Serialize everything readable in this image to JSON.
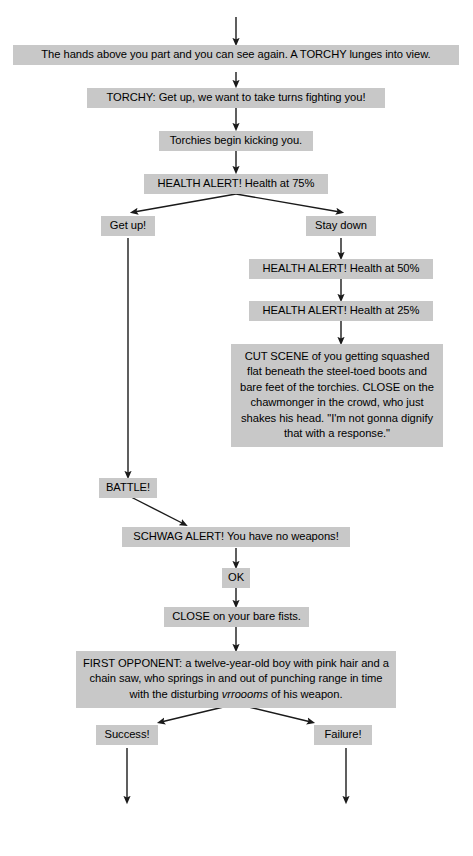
{
  "diagram": {
    "box_fill": "#c8c8c8",
    "text_color": "#000000",
    "background": "#ffffff",
    "arrow_color": "#1a1a1a"
  },
  "nodes": [
    {
      "id": "n1",
      "name": "hands-part-node",
      "text": "The hands above you part and you can see again. A TORCHY lunges into view."
    },
    {
      "id": "n2",
      "name": "torchy-speech-node",
      "text": "TORCHY: Get up, we want to take turns fighting you!"
    },
    {
      "id": "n3",
      "name": "torchies-kicking-node",
      "text": "Torchies begin kicking you."
    },
    {
      "id": "n4",
      "name": "health-alert-75-node",
      "text": "HEALTH ALERT! Health at 75%"
    },
    {
      "id": "n5",
      "name": "get-up-choice-node",
      "text": "Get up!"
    },
    {
      "id": "n6",
      "name": "stay-down-choice-node",
      "text": "Stay down"
    },
    {
      "id": "n7",
      "name": "health-alert-50-node",
      "text": "HEALTH ALERT! Health at 50%"
    },
    {
      "id": "n8",
      "name": "health-alert-25-node",
      "text": "HEALTH ALERT! Health at 25%"
    },
    {
      "id": "n9",
      "name": "cut-scene-node",
      "text": "CUT SCENE of you getting squashed flat beneath the steel-toed boots and bare feet of the torchies. CLOSE on the chawmonger in the crowd, who just shakes his head. \"I'm not gonna dignify that with a response.\""
    },
    {
      "id": "n10",
      "name": "battle-node",
      "text": "BATTLE!"
    },
    {
      "id": "n11",
      "name": "schwag-alert-node",
      "text": "SCHWAG ALERT! You have no weapons!"
    },
    {
      "id": "n12",
      "name": "ok-node",
      "text": "OK"
    },
    {
      "id": "n13",
      "name": "close-bare-fists-node",
      "text": "CLOSE on your bare fists."
    },
    {
      "id": "n14",
      "name": "first-opponent-node",
      "text_before": "FIRST OPPONENT: a twelve-year-old boy with pink hair and a chain saw, who springs in and out of punching range in time with the disturbing ",
      "text_italic": "vrroooms",
      "text_after": " of his weapon."
    },
    {
      "id": "n15",
      "name": "success-choice-node",
      "text": "Success!"
    },
    {
      "id": "n16",
      "name": "failure-choice-node",
      "text": "Failure!"
    }
  ],
  "edges": [
    {
      "name": "edge-incoming-top",
      "from": "(offscreen above)",
      "to": "n1"
    },
    {
      "name": "edge-hands-to-torchy",
      "from": "n1",
      "to": "n2"
    },
    {
      "name": "edge-torchy-to-kicking",
      "from": "n2",
      "to": "n3"
    },
    {
      "name": "edge-kicking-to-health75",
      "from": "n3",
      "to": "n4"
    },
    {
      "name": "edge-health75-to-getup",
      "from": "n4",
      "to": "n5"
    },
    {
      "name": "edge-health75-to-staydown",
      "from": "n4",
      "to": "n6"
    },
    {
      "name": "edge-staydown-to-health50",
      "from": "n6",
      "to": "n7"
    },
    {
      "name": "edge-health50-to-health25",
      "from": "n7",
      "to": "n8"
    },
    {
      "name": "edge-health25-to-cutscene",
      "from": "n8",
      "to": "n9"
    },
    {
      "name": "edge-getup-to-battle",
      "from": "n5",
      "to": "n10"
    },
    {
      "name": "edge-battle-to-schwag",
      "from": "n10",
      "to": "n11"
    },
    {
      "name": "edge-schwag-to-ok",
      "from": "n11",
      "to": "n12"
    },
    {
      "name": "edge-ok-to-close",
      "from": "n12",
      "to": "n13"
    },
    {
      "name": "edge-close-to-firstopponent",
      "from": "n13",
      "to": "n14"
    },
    {
      "name": "edge-firstopponent-to-success",
      "from": "n14",
      "to": "n15"
    },
    {
      "name": "edge-firstopponent-to-failure",
      "from": "n14",
      "to": "n16"
    },
    {
      "name": "edge-success-outgoing",
      "from": "n15",
      "to": "(offscreen below)"
    },
    {
      "name": "edge-failure-outgoing",
      "from": "n16",
      "to": "(offscreen below)"
    }
  ]
}
